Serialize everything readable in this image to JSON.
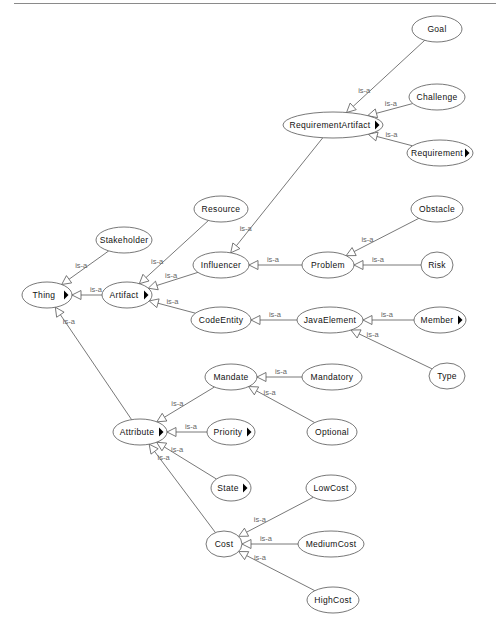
{
  "diagram": {
    "type": "ontology-class-hierarchy",
    "edge_label": "is-a",
    "colors": {
      "node_border": "#555555",
      "node_fill": "#ffffff",
      "text": "#111111",
      "edge_label": "#666666",
      "top_rule": "#8a8a8a"
    },
    "nodes": [
      {
        "id": "Thing",
        "label": "Thing",
        "x": 47,
        "y": 295,
        "rx": 25,
        "ry": 13,
        "expandable": true
      },
      {
        "id": "Stakeholder",
        "label": "Stakeholder",
        "x": 124,
        "y": 240,
        "rx": 28,
        "ry": 13,
        "expandable": false
      },
      {
        "id": "Artifact",
        "label": "Artifact",
        "x": 127,
        "y": 295,
        "rx": 25,
        "ry": 13,
        "expandable": true
      },
      {
        "id": "Resource",
        "label": "Resource",
        "x": 221,
        "y": 209,
        "rx": 27,
        "ry": 13,
        "expandable": false
      },
      {
        "id": "Influencer",
        "label": "Influencer",
        "x": 221,
        "y": 265,
        "rx": 28,
        "ry": 13,
        "expandable": false
      },
      {
        "id": "CodeEntity",
        "label": "CodeEntity",
        "x": 221,
        "y": 320,
        "rx": 30,
        "ry": 13,
        "expandable": false
      },
      {
        "id": "RequirementArtifact",
        "label": "RequirementArtifact",
        "x": 333,
        "y": 125,
        "rx": 50,
        "ry": 13,
        "expandable": true
      },
      {
        "id": "Goal",
        "label": "Goal",
        "x": 437,
        "y": 29,
        "rx": 25,
        "ry": 13,
        "expandable": false
      },
      {
        "id": "Challenge",
        "label": "Challenge",
        "x": 437,
        "y": 97,
        "rx": 28,
        "ry": 13,
        "expandable": false
      },
      {
        "id": "Requirement",
        "label": "Requirement",
        "x": 440,
        "y": 153,
        "rx": 33,
        "ry": 13,
        "expandable": true
      },
      {
        "id": "Problem",
        "label": "Problem",
        "x": 328,
        "y": 265,
        "rx": 26,
        "ry": 13,
        "expandable": false
      },
      {
        "id": "Obstacle",
        "label": "Obstacle",
        "x": 437,
        "y": 209,
        "rx": 26,
        "ry": 13,
        "expandable": false
      },
      {
        "id": "Risk",
        "label": "Risk",
        "x": 437,
        "y": 265,
        "rx": 16,
        "ry": 13,
        "expandable": false
      },
      {
        "id": "JavaElement",
        "label": "JavaElement",
        "x": 330,
        "y": 320,
        "rx": 33,
        "ry": 13,
        "expandable": false
      },
      {
        "id": "Member",
        "label": "Member",
        "x": 440,
        "y": 320,
        "rx": 26,
        "ry": 13,
        "expandable": true
      },
      {
        "id": "Type",
        "label": "Type",
        "x": 447,
        "y": 376,
        "rx": 18,
        "ry": 13,
        "expandable": false
      },
      {
        "id": "Mandate",
        "label": "Mandate",
        "x": 231,
        "y": 377,
        "rx": 26,
        "ry": 13,
        "expandable": false
      },
      {
        "id": "Mandatory",
        "label": "Mandatory",
        "x": 332,
        "y": 377,
        "rx": 30,
        "ry": 13,
        "expandable": false
      },
      {
        "id": "Optional",
        "label": "Optional",
        "x": 332,
        "y": 432,
        "rx": 25,
        "ry": 13,
        "expandable": false
      },
      {
        "id": "Attribute",
        "label": "Attribute",
        "x": 140,
        "y": 432,
        "rx": 27,
        "ry": 13,
        "expandable": true
      },
      {
        "id": "Priority",
        "label": "Priority",
        "x": 231,
        "y": 432,
        "rx": 24,
        "ry": 13,
        "expandable": true
      },
      {
        "id": "State",
        "label": "State",
        "x": 231,
        "y": 488,
        "rx": 20,
        "ry": 13,
        "expandable": true
      },
      {
        "id": "Cost",
        "label": "Cost",
        "x": 224,
        "y": 544,
        "rx": 18,
        "ry": 13,
        "expandable": false
      },
      {
        "id": "LowCost",
        "label": "LowCost",
        "x": 331,
        "y": 488,
        "rx": 25,
        "ry": 13,
        "expandable": false
      },
      {
        "id": "MediumCost",
        "label": "MediumCost",
        "x": 331,
        "y": 544,
        "rx": 33,
        "ry": 13,
        "expandable": false
      },
      {
        "id": "HighCost",
        "label": "HighCost",
        "x": 333,
        "y": 600,
        "rx": 26,
        "ry": 13,
        "expandable": false
      }
    ],
    "edges": [
      {
        "from": "Stakeholder",
        "to": "Thing",
        "label": "is-a"
      },
      {
        "from": "Artifact",
        "to": "Thing",
        "label": "is-a"
      },
      {
        "from": "Attribute",
        "to": "Thing",
        "label": "is-a"
      },
      {
        "from": "Resource",
        "to": "Artifact",
        "label": "is-a"
      },
      {
        "from": "Influencer",
        "to": "Artifact",
        "label": "is-a"
      },
      {
        "from": "CodeEntity",
        "to": "Artifact",
        "label": "is-a"
      },
      {
        "from": "RequirementArtifact",
        "to": "Influencer",
        "label": "is-a"
      },
      {
        "from": "Problem",
        "to": "Influencer",
        "label": "is-a"
      },
      {
        "from": "Goal",
        "to": "RequirementArtifact",
        "label": "is-a"
      },
      {
        "from": "Challenge",
        "to": "RequirementArtifact",
        "label": "is-a"
      },
      {
        "from": "Requirement",
        "to": "RequirementArtifact",
        "label": "is-a"
      },
      {
        "from": "Obstacle",
        "to": "Problem",
        "label": "is-a"
      },
      {
        "from": "Risk",
        "to": "Problem",
        "label": "is-a"
      },
      {
        "from": "JavaElement",
        "to": "CodeEntity",
        "label": "is-a"
      },
      {
        "from": "Member",
        "to": "JavaElement",
        "label": "is-a"
      },
      {
        "from": "Type",
        "to": "JavaElement",
        "label": "is-a"
      },
      {
        "from": "Mandate",
        "to": "Attribute",
        "label": "is-a"
      },
      {
        "from": "Priority",
        "to": "Attribute",
        "label": "is-a"
      },
      {
        "from": "State",
        "to": "Attribute",
        "label": "is-a"
      },
      {
        "from": "Cost",
        "to": "Attribute",
        "label": "is-a"
      },
      {
        "from": "Mandatory",
        "to": "Mandate",
        "label": "is-a"
      },
      {
        "from": "Optional",
        "to": "Mandate",
        "label": "is-a"
      },
      {
        "from": "LowCost",
        "to": "Cost",
        "label": "is-a"
      },
      {
        "from": "MediumCost",
        "to": "Cost",
        "label": "is-a"
      },
      {
        "from": "HighCost",
        "to": "Cost",
        "label": "is-a"
      }
    ]
  }
}
